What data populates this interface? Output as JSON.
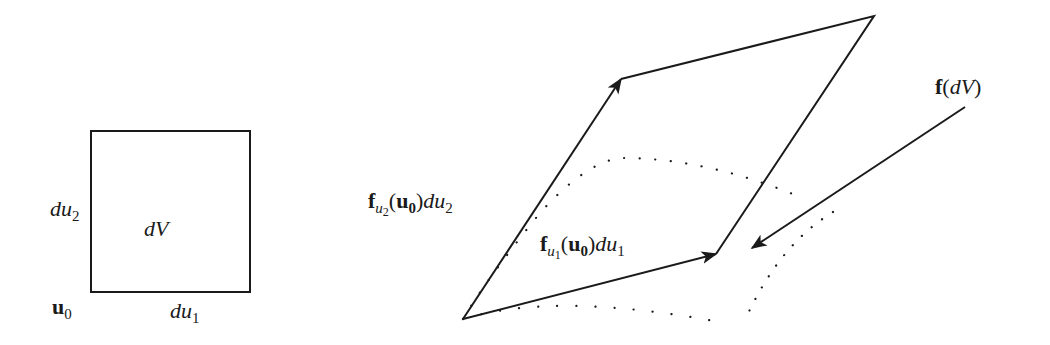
{
  "diagram": {
    "left_panel": {
      "shape": "square",
      "center_label": "dV",
      "side_label_vertical": {
        "base": "du",
        "sub": "2"
      },
      "side_label_horizontal": {
        "base": "du",
        "sub": "1"
      },
      "corner_label": {
        "base": "u",
        "sub": "0"
      }
    },
    "right_panel": {
      "shape": "parallelogram",
      "vector_u2_label": {
        "f": "f",
        "f_sub_base": "u",
        "f_sub_sub": "2",
        "arg": "u",
        "arg_sub": "0",
        "tail": "du",
        "tail_sub": "2"
      },
      "vector_u1_label": {
        "f": "f",
        "f_sub_base": "u",
        "f_sub_sub": "1",
        "arg": "u",
        "arg_sub": "0",
        "tail": "du",
        "tail_sub": "1"
      },
      "image_label": {
        "f": "f",
        "open": "(",
        "arg": "dV",
        "close": ")"
      },
      "curved_region_style": "dotted"
    },
    "colors": {
      "stroke": "#1a1a1a",
      "background": "#ffffff"
    }
  }
}
